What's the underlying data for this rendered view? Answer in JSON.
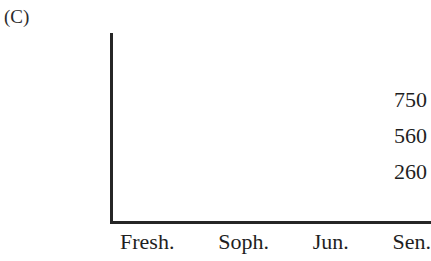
{
  "figure": {
    "panel_label": "(C)",
    "axis_color": "#262626",
    "text_color": "#1f1f1f",
    "background_color": "#ffffff"
  },
  "chart_data": {
    "type": "bar",
    "title": "",
    "subtitle": "",
    "xlabel": "",
    "ylabel": "",
    "categories": [
      "Fresh.",
      "Soph.",
      "Jun.",
      "Sen."
    ],
    "values": [
      null,
      null,
      null,
      null
    ],
    "series": [],
    "ytick_labels": [
      "750",
      "560",
      "260"
    ],
    "ytick_values": [
      750,
      560,
      260
    ],
    "ylim": [
      0,
      750
    ],
    "grid": false,
    "legend": false,
    "legend_position": "none",
    "annotations": [],
    "note": "Empty axis frame: axes and tick labels drawn, no data marks plotted"
  }
}
